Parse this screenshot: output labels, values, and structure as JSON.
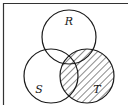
{
  "diagram": {
    "type": "venn",
    "sets": [
      {
        "name": "R",
        "label": "R",
        "cx": 69,
        "cy": 37,
        "r": 27,
        "label_x": 69,
        "label_y": 25
      },
      {
        "name": "S",
        "label": "S",
        "cx": 51,
        "cy": 76,
        "r": 27,
        "label_x": 38,
        "label_y": 92
      },
      {
        "name": "T",
        "label": "T",
        "cx": 87,
        "cy": 76,
        "r": 27,
        "label_x": 97,
        "label_y": 92
      }
    ],
    "shaded_region": "T",
    "shading": "diagonal-hatch",
    "colors": {
      "stroke": "#1a1a1a",
      "background": "#ffffff",
      "frame": "#333333"
    }
  }
}
